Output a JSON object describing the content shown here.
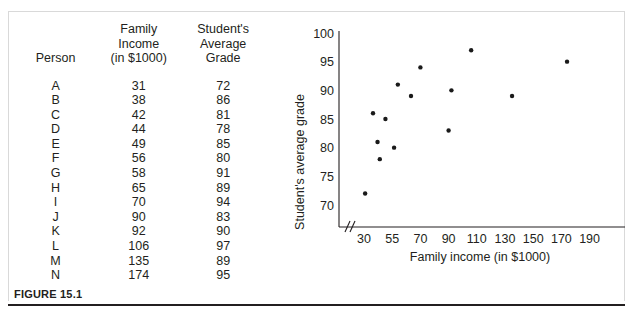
{
  "figure": {
    "caption": "FIGURE 15.1"
  },
  "table": {
    "headers": {
      "person": [
        "Person"
      ],
      "income": [
        "Family",
        "Income",
        "(in $1000)"
      ],
      "grade": [
        "Student's",
        "Average",
        "Grade"
      ]
    },
    "rows": [
      {
        "person": "A",
        "income": "31",
        "grade": "72"
      },
      {
        "person": "B",
        "income": "38",
        "grade": "86"
      },
      {
        "person": "C",
        "income": "42",
        "grade": "81"
      },
      {
        "person": "D",
        "income": "44",
        "grade": "78"
      },
      {
        "person": "E",
        "income": "49",
        "grade": "85"
      },
      {
        "person": "F",
        "income": "56",
        "grade": "80"
      },
      {
        "person": "G",
        "income": "58",
        "grade": "91"
      },
      {
        "person": "H",
        "income": "65",
        "grade": "89"
      },
      {
        "person": "I",
        "income": "70",
        "grade": "94"
      },
      {
        "person": "J",
        "income": "90",
        "grade": "83"
      },
      {
        "person": "K",
        "income": "92",
        "grade": "90"
      },
      {
        "person": "L",
        "income": "106",
        "grade": "97"
      },
      {
        "person": "M",
        "income": "135",
        "grade": "89"
      },
      {
        "person": "N",
        "income": "174",
        "grade": "95"
      }
    ]
  },
  "chart_data": {
    "type": "scatter",
    "title": "",
    "xlabel": "Family income (in $1000)",
    "ylabel": "Student's average grade",
    "x_ticks": [
      30,
      55,
      70,
      90,
      110,
      130,
      150,
      170,
      190
    ],
    "y_ticks": [
      70,
      75,
      80,
      85,
      90,
      95,
      100
    ],
    "xlim": [
      30,
      190
    ],
    "ylim": [
      70,
      100
    ],
    "grid": false,
    "legend": null,
    "axis_break_x": true,
    "axis_break_y": true,
    "point_labels": [
      "A",
      "B",
      "C",
      "D",
      "E",
      "F",
      "G",
      "H",
      "I",
      "J",
      "K",
      "L",
      "M",
      "N"
    ],
    "x": [
      31,
      38,
      42,
      44,
      49,
      56,
      58,
      65,
      70,
      90,
      92,
      106,
      135,
      174
    ],
    "y": [
      72,
      86,
      81,
      78,
      85,
      80,
      91,
      89,
      94,
      83,
      90,
      97,
      89,
      95
    ],
    "points": [
      {
        "label": "A",
        "x": 31,
        "y": 72
      },
      {
        "label": "B",
        "x": 38,
        "y": 86
      },
      {
        "label": "C",
        "x": 42,
        "y": 81
      },
      {
        "label": "D",
        "x": 44,
        "y": 78
      },
      {
        "label": "E",
        "x": 49,
        "y": 85
      },
      {
        "label": "F",
        "x": 56,
        "y": 80
      },
      {
        "label": "G",
        "x": 58,
        "y": 91
      },
      {
        "label": "H",
        "x": 65,
        "y": 89
      },
      {
        "label": "I",
        "x": 70,
        "y": 94
      },
      {
        "label": "J",
        "x": 90,
        "y": 83
      },
      {
        "label": "K",
        "x": 92,
        "y": 90
      },
      {
        "label": "L",
        "x": 106,
        "y": 97
      },
      {
        "label": "M",
        "x": 135,
        "y": 89
      },
      {
        "label": "N",
        "x": 174,
        "y": 95
      }
    ]
  }
}
